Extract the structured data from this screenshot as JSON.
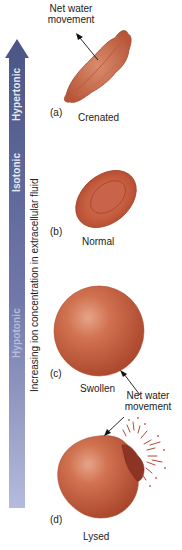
{
  "axis": {
    "label": "Increasing ion concentration in extracellular fluid",
    "zones": {
      "hypertonic": "Hypertonic",
      "isotonic": "Isotonic",
      "hypotonic": "Hypotonic"
    },
    "arrow_color_top": "#4b5586",
    "arrow_color_bottom": "#aab2d6"
  },
  "panels": [
    {
      "letter": "(a)",
      "name": "Crenated"
    },
    {
      "letter": "(b)",
      "name": "Normal"
    },
    {
      "letter": "(c)",
      "name": "Swollen"
    },
    {
      "letter": "(d)",
      "name": "Lysed"
    }
  ],
  "annotations": {
    "net_water_top_line1": "Net water",
    "net_water_top_line2": "movement",
    "net_water_bottom_line1": "Net water",
    "net_water_bottom_line2": "movement"
  },
  "colors": {
    "cell": "#c4563a",
    "cell_light": "#e08a6a",
    "cell_dark": "#9a3a26"
  }
}
